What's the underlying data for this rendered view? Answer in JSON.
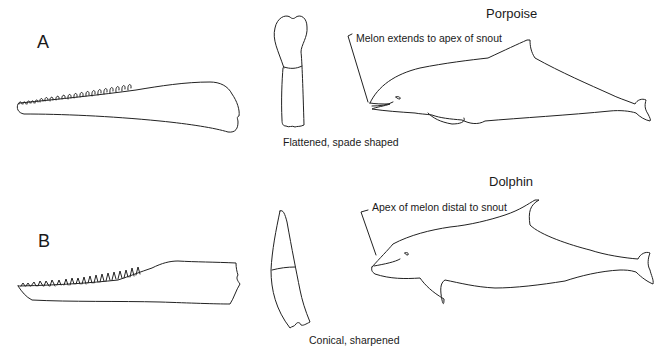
{
  "rows": [
    {
      "letter": "A",
      "species": "Porpoise",
      "tooth_caption": "Flattened, spade shaped",
      "melon_callout": "Melon extends to apex of snout"
    },
    {
      "letter": "B",
      "species": "Dolphin",
      "tooth_caption": "Conical, sharpened",
      "melon_callout": "Apex of melon distal to snout"
    }
  ],
  "figure": {
    "columns": [
      "lower jaw with teeth",
      "single tooth",
      "body profile"
    ],
    "colors": {
      "line": "#222222",
      "background": "#ffffff"
    }
  }
}
